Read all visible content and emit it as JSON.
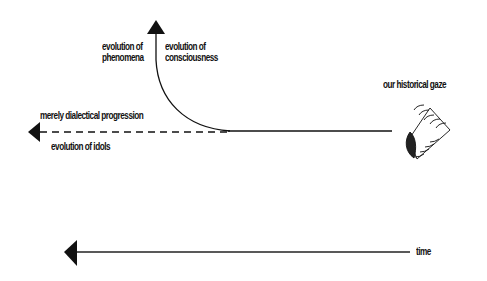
{
  "diagram": {
    "labels": {
      "evolution_of_phenomena": [
        "evolution of",
        "phenomena"
      ],
      "evolution_of_consciousness": [
        "evolution of",
        "consciousness"
      ],
      "merely_dialectical_progression": "merely dialectical progression",
      "evolution_of_idols": "evolution of idols",
      "our_historical_gaze": "our historical gaze",
      "time": "time"
    },
    "colors": {
      "ink": "#111111",
      "background": "#ffffff"
    },
    "elements": {
      "upward_arrow": "curved arrow rising to top (evolution of phenomena / consciousness)",
      "dashed_arrow": "dashed arrow pointing left (merely dialectical progression / evolution of idols)",
      "solid_baseline": "solid line from eye to branch point",
      "eye": "eye icon with lashes looking left (our historical gaze)",
      "time_arrow": "long solid arrow pointing left labeled time"
    }
  }
}
